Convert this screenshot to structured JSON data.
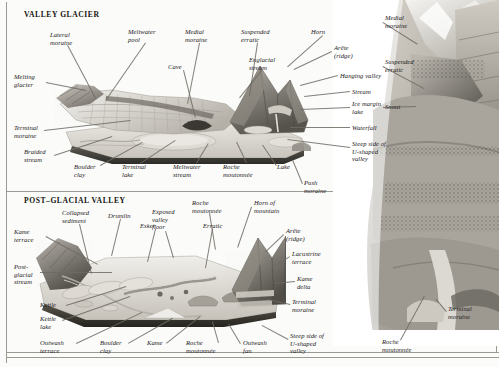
{
  "page": {
    "width": 499,
    "height": 367,
    "background": "#fbfbf9",
    "ink": "#23201c"
  },
  "panels": {
    "valley_glacier": {
      "heading": "VALLEY GLACIER"
    },
    "post_glacial": {
      "heading": "POST–GLACIAL VALLEY"
    }
  },
  "labels": {
    "valley_glacier": [
      {
        "text": "Lateral\nmoraine",
        "x": 50,
        "y": 31,
        "align": "left"
      },
      {
        "text": "Meltwater\npool",
        "x": 128,
        "y": 28,
        "align": "left"
      },
      {
        "text": "Medial\nmoraine",
        "x": 185,
        "y": 28,
        "align": "left"
      },
      {
        "text": "Suspended\nerratic",
        "x": 241,
        "y": 28,
        "align": "left"
      },
      {
        "text": "Horn",
        "x": 311,
        "y": 28,
        "align": "left"
      },
      {
        "text": "Cave",
        "x": 168,
        "y": 63,
        "align": "left"
      },
      {
        "text": "Englacial\nstream",
        "x": 249,
        "y": 56,
        "align": "left"
      },
      {
        "text": "Arête\n(ridge)",
        "x": 334,
        "y": 44,
        "align": "left"
      },
      {
        "text": "Hanging valley",
        "x": 340,
        "y": 72,
        "align": "left"
      },
      {
        "text": "Stream",
        "x": 352,
        "y": 88,
        "align": "left"
      },
      {
        "text": "Ice margin\nlake",
        "x": 352,
        "y": 100,
        "align": "left"
      },
      {
        "text": "Waterfall",
        "x": 352,
        "y": 124,
        "align": "left"
      },
      {
        "text": "Steep side of\nU-shaped\nvalley",
        "x": 352,
        "y": 140,
        "align": "left"
      },
      {
        "text": "Melting\nglacier",
        "x": 14,
        "y": 73,
        "align": "left"
      },
      {
        "text": "Terminal\nmoraine",
        "x": 14,
        "y": 124,
        "align": "left"
      },
      {
        "text": "Braided\nstream",
        "x": 24,
        "y": 148,
        "align": "left"
      },
      {
        "text": "Boulder\nclay",
        "x": 74,
        "y": 163,
        "align": "left"
      },
      {
        "text": "Terminal\nlake",
        "x": 122,
        "y": 163,
        "align": "left"
      },
      {
        "text": "Meltwater\nstream",
        "x": 173,
        "y": 163,
        "align": "left"
      },
      {
        "text": "Roche\nmoutonnée",
        "x": 223,
        "y": 163,
        "align": "left"
      },
      {
        "text": "Lake",
        "x": 277,
        "y": 163,
        "align": "left"
      },
      {
        "text": "Push\nmoraine",
        "x": 304,
        "y": 179,
        "align": "left"
      }
    ],
    "post_glacial": [
      {
        "text": "Collapsed\nsediment",
        "x": 62,
        "y": 209,
        "align": "left"
      },
      {
        "text": "Drumlin",
        "x": 108,
        "y": 212,
        "align": "left"
      },
      {
        "text": "Esker",
        "x": 140,
        "y": 222,
        "align": "left"
      },
      {
        "text": "Exposed\nvalley\nfloor",
        "x": 152,
        "y": 208,
        "align": "left"
      },
      {
        "text": "Erratic",
        "x": 203,
        "y": 222,
        "align": "left"
      },
      {
        "text": "Roche\nmoutonnée",
        "x": 192,
        "y": 199,
        "align": "left"
      },
      {
        "text": "Horn of\nmountain",
        "x": 254,
        "y": 199,
        "align": "left"
      },
      {
        "text": "Arête\n(ridge)",
        "x": 286,
        "y": 227,
        "align": "left"
      },
      {
        "text": "Lacustrine\nterrace",
        "x": 292,
        "y": 250,
        "align": "left"
      },
      {
        "text": "Kame\ndelta",
        "x": 297,
        "y": 275,
        "align": "left"
      },
      {
        "text": "Terminal\nmoraine",
        "x": 292,
        "y": 298,
        "align": "left"
      },
      {
        "text": "Steep side of\nU-shaped\nvalley",
        "x": 290,
        "y": 332,
        "align": "left"
      },
      {
        "text": "Kame\nterrace",
        "x": 14,
        "y": 228,
        "align": "left"
      },
      {
        "text": "Post-\nglacial\nstream",
        "x": 14,
        "y": 263,
        "align": "left"
      },
      {
        "text": "Kettle",
        "x": 40,
        "y": 301,
        "align": "left"
      },
      {
        "text": "Kettle\nlake",
        "x": 40,
        "y": 315,
        "align": "left"
      },
      {
        "text": "Outwash\nterrace",
        "x": 40,
        "y": 339,
        "align": "left"
      },
      {
        "text": "Boulder\nclay",
        "x": 100,
        "y": 339,
        "align": "left"
      },
      {
        "text": "Kame",
        "x": 147,
        "y": 339,
        "align": "left"
      },
      {
        "text": "Roche\nmoutonnée",
        "x": 186,
        "y": 339,
        "align": "left"
      },
      {
        "text": "Outwash\nfan",
        "x": 243,
        "y": 339,
        "align": "left"
      }
    ],
    "photograph": [
      {
        "text": "Medial\nmoraine",
        "x": 385,
        "y": 14,
        "align": "left"
      },
      {
        "text": "Suspended\nerratic",
        "x": 385,
        "y": 58,
        "align": "left"
      },
      {
        "text": "Snout",
        "x": 385,
        "y": 103,
        "align": "left"
      },
      {
        "text": "Terminal\nmoraine",
        "x": 448,
        "y": 305,
        "align": "left"
      },
      {
        "text": "Roche\nmoutonnée",
        "x": 382,
        "y": 338,
        "align": "left"
      }
    ]
  },
  "leaders": {
    "valley_glacier": [
      {
        "x1": 68,
        "y1": 45,
        "x2": 96,
        "y2": 98
      },
      {
        "x1": 146,
        "y1": 43,
        "x2": 106,
        "y2": 101
      },
      {
        "x1": 200,
        "y1": 43,
        "x2": 188,
        "y2": 104
      },
      {
        "x1": 258,
        "y1": 43,
        "x2": 250,
        "y2": 96
      },
      {
        "x1": 323,
        "y1": 36,
        "x2": 288,
        "y2": 67
      },
      {
        "x1": 184,
        "y1": 70,
        "x2": 196,
        "y2": 118
      },
      {
        "x1": 262,
        "y1": 71,
        "x2": 240,
        "y2": 98
      },
      {
        "x1": 332,
        "y1": 52,
        "x2": 294,
        "y2": 70
      },
      {
        "x1": 338,
        "y1": 76,
        "x2": 300,
        "y2": 86
      },
      {
        "x1": 350,
        "y1": 92,
        "x2": 304,
        "y2": 97
      },
      {
        "x1": 350,
        "y1": 108,
        "x2": 300,
        "y2": 110
      },
      {
        "x1": 350,
        "y1": 128,
        "x2": 290,
        "y2": 128
      },
      {
        "x1": 350,
        "y1": 148,
        "x2": 288,
        "y2": 140
      },
      {
        "x1": 46,
        "y1": 82,
        "x2": 86,
        "y2": 90
      },
      {
        "x1": 44,
        "y1": 130,
        "x2": 130,
        "y2": 120
      },
      {
        "x1": 54,
        "y1": 155,
        "x2": 112,
        "y2": 136
      },
      {
        "x1": 100,
        "y1": 165,
        "x2": 142,
        "y2": 142
      },
      {
        "x1": 140,
        "y1": 163,
        "x2": 175,
        "y2": 140
      },
      {
        "x1": 196,
        "y1": 163,
        "x2": 208,
        "y2": 143
      },
      {
        "x1": 246,
        "y1": 163,
        "x2": 236,
        "y2": 142
      },
      {
        "x1": 276,
        "y1": 166,
        "x2": 262,
        "y2": 145
      },
      {
        "x1": 302,
        "y1": 184,
        "x2": 292,
        "y2": 160
      }
    ],
    "post_glacial": [
      {
        "x1": 80,
        "y1": 224,
        "x2": 92,
        "y2": 274
      },
      {
        "x1": 121,
        "y1": 219,
        "x2": 112,
        "y2": 256
      },
      {
        "x1": 156,
        "y1": 229,
        "x2": 148,
        "y2": 262
      },
      {
        "x1": 166,
        "y1": 231,
        "x2": 174,
        "y2": 258
      },
      {
        "x1": 213,
        "y1": 229,
        "x2": 206,
        "y2": 268
      },
      {
        "x1": 210,
        "y1": 213,
        "x2": 216,
        "y2": 250
      },
      {
        "x1": 252,
        "y1": 207,
        "x2": 238,
        "y2": 248
      },
      {
        "x1": 284,
        "y1": 235,
        "x2": 266,
        "y2": 252
      },
      {
        "x1": 290,
        "y1": 257,
        "x2": 272,
        "y2": 268
      },
      {
        "x1": 295,
        "y1": 282,
        "x2": 274,
        "y2": 284
      },
      {
        "x1": 290,
        "y1": 305,
        "x2": 268,
        "y2": 300
      },
      {
        "x1": 288,
        "y1": 340,
        "x2": 262,
        "y2": 326
      },
      {
        "x1": 46,
        "y1": 236,
        "x2": 98,
        "y2": 264
      },
      {
        "x1": 40,
        "y1": 272,
        "x2": 112,
        "y2": 272
      },
      {
        "x1": 66,
        "y1": 305,
        "x2": 126,
        "y2": 286
      },
      {
        "x1": 62,
        "y1": 320,
        "x2": 130,
        "y2": 296
      },
      {
        "x1": 76,
        "y1": 343,
        "x2": 142,
        "y2": 312
      },
      {
        "x1": 128,
        "y1": 343,
        "x2": 172,
        "y2": 318
      },
      {
        "x1": 166,
        "y1": 343,
        "x2": 200,
        "y2": 316
      },
      {
        "x1": 218,
        "y1": 343,
        "x2": 212,
        "y2": 322
      },
      {
        "x1": 240,
        "y1": 344,
        "x2": 228,
        "y2": 324
      }
    ],
    "photograph": [
      {
        "x1": 383,
        "y1": 22,
        "x2": 418,
        "y2": 44
      },
      {
        "x1": 383,
        "y1": 66,
        "x2": 424,
        "y2": 88
      },
      {
        "x1": 383,
        "y1": 107,
        "x2": 416,
        "y2": 106
      },
      {
        "x1": 446,
        "y1": 312,
        "x2": 436,
        "y2": 300
      },
      {
        "x1": 400,
        "y1": 340,
        "x2": 424,
        "y2": 296
      }
    ]
  },
  "colors": {
    "rule": "#9a9a93",
    "leader": "#6d6a63",
    "label_ink": "#23201c",
    "heading_ink": "#15130f",
    "plate_light": "#e8e6e0",
    "plate_mid": "#b9b5ad",
    "plate_dark": "#6b675f",
    "photo_light": "#cfcbc2",
    "photo_mid": "#8e8a82",
    "photo_dark": "#474440"
  }
}
